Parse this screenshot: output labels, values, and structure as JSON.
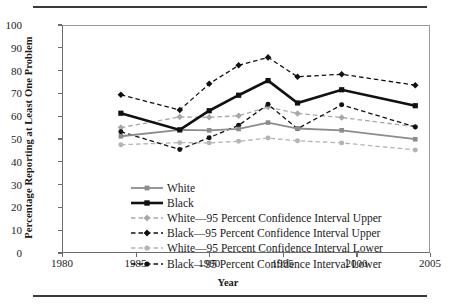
{
  "chart_data": {
    "type": "line",
    "title": "",
    "xlabel": "Year",
    "ylabel": "Percentage Reporting at Least One Problem",
    "xlim": [
      1980,
      2005
    ],
    "ylim": [
      0,
      100
    ],
    "xticks": [
      "1980",
      "1985",
      "1990",
      "1995",
      "2000",
      "2005"
    ],
    "yticks": [
      "0",
      "10",
      "20",
      "30",
      "40",
      "50",
      "60",
      "70",
      "80",
      "90",
      "100"
    ],
    "grid": false,
    "legend_position": "inside-lower-left",
    "x": [
      1984,
      1988,
      1990,
      1992,
      1994,
      1996,
      1999,
      2004
    ],
    "series": [
      {
        "name": "White",
        "color": "#8c8c8c",
        "marker": "square",
        "dash": "solid",
        "width": 1.8,
        "values": [
          51.2,
          54.0,
          53.8,
          54.4,
          57.2,
          54.6,
          53.8,
          49.9
        ]
      },
      {
        "name": "Black",
        "color": "#111111",
        "marker": "square",
        "dash": "solid",
        "width": 2.6,
        "values": [
          61.3,
          54.0,
          62.4,
          69.2,
          75.6,
          65.8,
          71.6,
          64.6
        ]
      },
      {
        "name": "White—95 Percent Confidence Interval Upper",
        "color": "#a8a8a8",
        "marker": "diamond",
        "dash": "dashed",
        "width": 1.3,
        "values": [
          55.0,
          59.7,
          59.5,
          60.2,
          64.0,
          61.2,
          59.4,
          55.4
        ]
      },
      {
        "name": "Black—95 Percent Confidence Interval Upper",
        "color": "#111111",
        "marker": "diamond",
        "dash": "dashed",
        "width": 1.3,
        "values": [
          69.4,
          62.7,
          74.2,
          82.3,
          85.8,
          77.3,
          78.4,
          73.6
        ]
      },
      {
        "name": "White—95 Percent Confidence Interval Lower",
        "color": "#b4b4b4",
        "marker": "circle",
        "dash": "dashed",
        "width": 1.3,
        "values": [
          47.5,
          48.4,
          48.3,
          49.0,
          50.4,
          49.2,
          48.3,
          45.2
        ]
      },
      {
        "name": "Black—95 Percent Confidence Interval Lower",
        "color": "#111111",
        "marker": "circle",
        "dash": "dashed",
        "width": 1.3,
        "values": [
          53.2,
          45.4,
          50.6,
          56.0,
          65.2,
          54.5,
          65.0,
          55.3
        ]
      }
    ]
  }
}
